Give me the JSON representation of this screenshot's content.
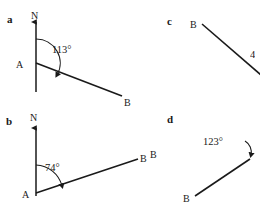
{
  "figure": {
    "type": "bearing-diagrams",
    "stroke_color": "#1a1a1a",
    "background": "#ffffff",
    "parts": [
      {
        "key": "a",
        "label": "a",
        "label_pos": {
          "x": 7,
          "y": 14
        },
        "north_label": "N",
        "north_label_pos": {
          "x": 31,
          "y": 11
        },
        "vertex_label": "A",
        "vertex_label_pos": {
          "x": 16,
          "y": 60
        },
        "endpoint_label": "B",
        "endpoint_label_pos": {
          "x": 124,
          "y": 98
        },
        "angle_text": "113°",
        "angle_label_pos": {
          "x": 52,
          "y": 45
        },
        "angle_value": 113,
        "vertex": {
          "x": 36,
          "y": 63
        },
        "north_tip": {
          "x": 36,
          "y": 20
        },
        "axis_bottom": {
          "x": 36,
          "y": 92
        },
        "ray_end": {
          "x": 122,
          "y": 96
        },
        "arc_radius": 24
      },
      {
        "key": "b",
        "label": "b",
        "label_pos": {
          "x": 6,
          "y": 116
        },
        "north_label": "N",
        "north_label_pos": {
          "x": 30,
          "y": 113
        },
        "vertex_label": "A",
        "vertex_label_pos": {
          "x": 22,
          "y": 190
        },
        "endpoint_label": "B",
        "endpoint_label_pos": {
          "x": 140,
          "y": 154
        },
        "angle_text": "74°",
        "angle_label_pos": {
          "x": 45,
          "y": 163
        },
        "angle_value": 74,
        "vertex": {
          "x": 36,
          "y": 193
        },
        "north_tip": {
          "x": 36,
          "y": 126
        },
        "ray_end": {
          "x": 138,
          "y": 159
        },
        "arc_radius": 28
      },
      {
        "key": "c",
        "label": "c",
        "label_pos": {
          "x": 167,
          "y": 16
        },
        "endpoint_label": "B",
        "endpoint_label_pos": {
          "x": 190,
          "y": 20
        },
        "angle_text": "4",
        "angle_label_pos": {
          "x": 250,
          "y": 50
        },
        "start": {
          "x": 202,
          "y": 24
        },
        "end": {
          "x": 260,
          "y": 74
        },
        "clipped_right": true
      },
      {
        "key": "d",
        "label": "d",
        "label_pos": {
          "x": 167,
          "y": 114
        },
        "endpoint_label": "B",
        "endpoint_label_pos": {
          "x": 183,
          "y": 194
        },
        "angle_text": "123°",
        "angle_label_pos": {
          "x": 203,
          "y": 137
        },
        "angle_value": 123,
        "start": {
          "x": 195,
          "y": 196
        },
        "end": {
          "x": 249,
          "y": 160
        },
        "clipped_right": true
      }
    ],
    "stray_labels": [
      {
        "text": "B",
        "x": 150,
        "y": 150
      }
    ]
  }
}
